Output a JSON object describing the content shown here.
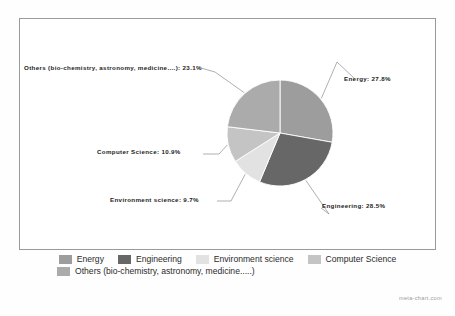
{
  "chart_data": {
    "type": "pie",
    "title": "",
    "subtitle": "",
    "xlabel": "",
    "ylabel": "",
    "legend_position": "bottom",
    "grid": false,
    "categories": [
      "Energy",
      "Engineering",
      "Environment science",
      "Computer Science",
      "Others (bio-chemistry, astronomy, medicine.....)"
    ],
    "values": [
      27.8,
      28.5,
      9.7,
      10.9,
      23.1
    ],
    "value_unit": "%",
    "colors": [
      "#9d9d9d",
      "#676767",
      "#e2e2e2",
      "#c4c4c4",
      "#ababab"
    ],
    "slices": [
      {
        "label": "Energy",
        "value": 27.8,
        "color": "#9d9d9d",
        "callout": "Energy: 27.8%"
      },
      {
        "label": "Engineering",
        "value": 28.5,
        "color": "#676767",
        "callout": "Engineering: 28.5%"
      },
      {
        "label": "Environment science",
        "value": 9.7,
        "color": "#e2e2e2",
        "callout": "Environment science: 9.7%"
      },
      {
        "label": "Computer Science",
        "value": 10.9,
        "color": "#c4c4c4",
        "callout": "Computer Science: 10.9%"
      },
      {
        "label": "Others (bio-chemistry, astronomy, medicine.....)",
        "value": 23.1,
        "color": "#ababab",
        "callout": "Others (bio-chemistry, astronomy, medicine....): 23.1%"
      }
    ]
  },
  "callouts": {
    "energy": "Energy: 27.8%",
    "engineering": "Engineering: 28.5%",
    "environment_science": "Environment science: 9.7%",
    "computer_science": "Computer Science: 10.9%",
    "others": "Others (bio-chemistry, astronomy, medicine....): 23.1%"
  },
  "legend": {
    "row1": [
      {
        "label": "Energy",
        "color": "#9d9d9d"
      },
      {
        "label": "Engineering",
        "color": "#676767"
      },
      {
        "label": "Environment science",
        "color": "#e2e2e2"
      },
      {
        "label": "Computer Science",
        "color": "#c4c4c4"
      }
    ],
    "row2": [
      {
        "label": "Others (bio-chemistry, astronomy, medicine.....)",
        "color": "#ababab"
      }
    ]
  },
  "footer": {
    "watermark": "meta-chart.com"
  },
  "style": {
    "frame_border": "#9a9a9a",
    "leader_line": "#8d8d8d",
    "slice_divider": "#ffffff",
    "background": "#ffffff"
  }
}
